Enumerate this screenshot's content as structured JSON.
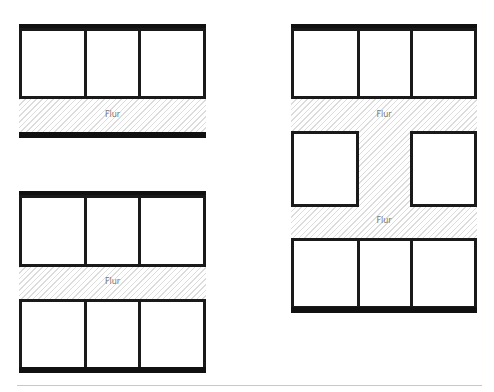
{
  "diagram": {
    "type": "floor-plan-layouts",
    "colors": {
      "wall": "#111111",
      "room_border": "#1a1a1a",
      "corridor_hatch": "#dcdcdc",
      "label": "#777777",
      "rule": "#c8c8c8"
    },
    "plans": [
      {
        "name": "single-loaded",
        "rooms_top": 3,
        "corridor_label": "Flur"
      },
      {
        "name": "double-loaded",
        "rooms_top": 3,
        "rooms_bottom": 3,
        "corridor_label": "Flur"
      },
      {
        "name": "triple-tract",
        "rooms_top": 3,
        "rooms_middle": 2,
        "rooms_bottom": 3,
        "corridor_labels": [
          "Flur",
          "Flur"
        ]
      }
    ]
  }
}
